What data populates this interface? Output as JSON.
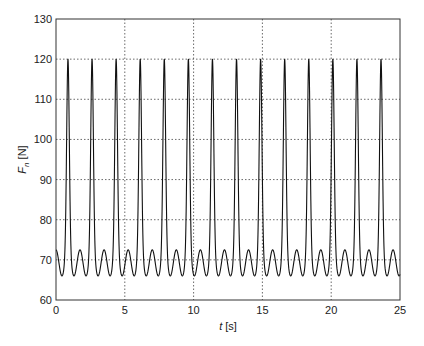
{
  "chart_data": {
    "type": "line",
    "title": "",
    "xlabel": "t [s]",
    "xlabel_var": "t",
    "xlabel_unit": " [s]",
    "ylabel": "F_n [N]",
    "ylabel_var": "F",
    "ylabel_sub": "n",
    "ylabel_unit": " [N]",
    "xlim": [
      0,
      25
    ],
    "ylim": [
      60,
      130
    ],
    "xticks": [
      0,
      5,
      10,
      15,
      20,
      25
    ],
    "yticks": [
      60,
      70,
      80,
      90,
      100,
      110,
      120,
      130
    ],
    "grid": true,
    "grid_style": "dotted",
    "legend": null,
    "line_color": "#111111",
    "waveform": {
      "description": "Periodic normal force: tall narrow peaks with a small bump between each pair",
      "period_s": 1.75,
      "first_peak_s": 0.87,
      "peak_value": 120,
      "small_bump_value": 72.5,
      "minimum_value": 66,
      "peak_count": 14
    },
    "series": [
      {
        "name": "F_n",
        "peak_times_s": [
          0.87,
          2.54,
          4.28,
          6.01,
          7.83,
          9.57,
          11.3,
          13.12,
          14.86,
          16.6,
          18.33,
          20.07,
          21.81,
          23.62
        ],
        "peak_values": [
          120,
          120,
          120,
          120,
          120,
          120,
          120,
          120,
          120,
          120,
          120,
          120,
          120,
          120
        ]
      }
    ]
  }
}
